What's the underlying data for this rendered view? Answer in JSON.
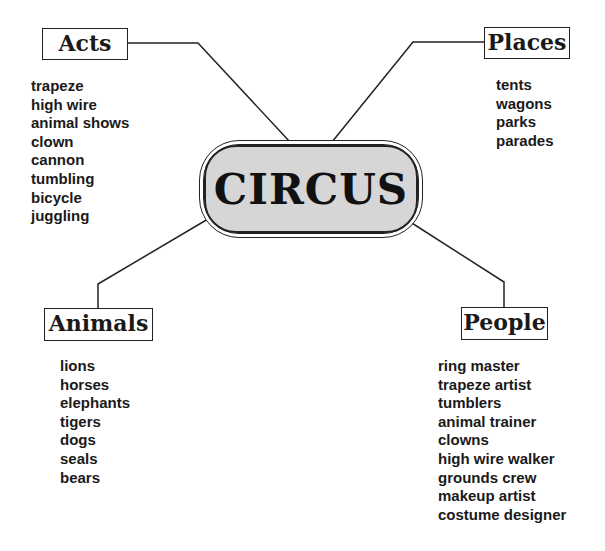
{
  "diagram": {
    "center": {
      "title": "CIRCUS"
    },
    "categories": [
      {
        "name": "Acts",
        "items": [
          "trapeze",
          "high wire",
          "animal shows",
          "clown",
          "cannon",
          "tumbling",
          "bicycle",
          "juggling"
        ]
      },
      {
        "name": "Places",
        "items": [
          "tents",
          "wagons",
          "parks",
          "parades"
        ]
      },
      {
        "name": "Animals",
        "items": [
          "lions",
          "horses",
          "elephants",
          "tigers",
          "dogs",
          "seals",
          "bears"
        ]
      },
      {
        "name": "People",
        "items": [
          "ring master",
          "trapeze artist",
          "tumblers",
          "animal trainer",
          "clowns",
          "high wire walker",
          "grounds crew",
          "makeup artist",
          "costume designer"
        ]
      }
    ],
    "colors": {
      "line": "#222222",
      "center_fill": "#d6d6d6",
      "text": "#1a1a1a"
    }
  }
}
